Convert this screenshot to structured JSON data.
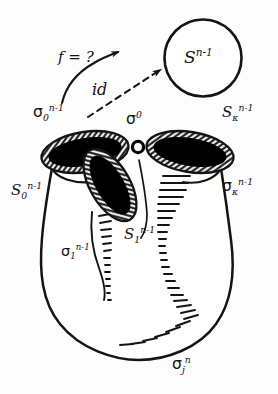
{
  "figure": {
    "background_color": "#fdfdfd",
    "ink_color": "#141414",
    "fill_color": "#000000"
  },
  "sphere": {
    "name": "target-sphere",
    "label_base": "S",
    "label_sup": "n-1",
    "cx": 203,
    "cy": 58,
    "r": 38
  },
  "arrows": [
    {
      "name": "f-arrow",
      "label": "f = ?",
      "style": "solid-curved",
      "label_x": 58,
      "label_y": 50
    },
    {
      "name": "id-arrow",
      "label": "id",
      "style": "dashed-straight",
      "label_x": 92,
      "label_y": 82
    }
  ],
  "labels": [
    {
      "name": "label-sigma-0-n-1",
      "base": "σ",
      "sub": "0",
      "sup": "n-1",
      "x": 33,
      "y": 103,
      "size": 15
    },
    {
      "name": "label-sigma-0-cell",
      "base": "σ",
      "sub": "",
      "sup": "0",
      "x": 126,
      "y": 110,
      "size": 15
    },
    {
      "name": "label-S-kappa-n-1",
      "base": "S",
      "sub": "κ",
      "sup": "n-1",
      "x": 222,
      "y": 103,
      "size": 15
    },
    {
      "name": "label-S-0-n-1",
      "base": "S",
      "sub": "0",
      "sup": "n-1",
      "x": 11,
      "y": 181,
      "size": 15
    },
    {
      "name": "label-sigma-kappa-n-1",
      "base": "σ",
      "sub": "κ",
      "sup": "n-1",
      "x": 222,
      "y": 177,
      "size": 15
    },
    {
      "name": "label-S-1-n-1",
      "base": "S",
      "sub": "1",
      "sup": "n-1",
      "x": 124,
      "y": 225,
      "size": 15
    },
    {
      "name": "label-sigma-1-n-1",
      "base": "σ",
      "sub": "1",
      "sup": "n-1",
      "x": 61,
      "y": 243,
      "size": 14
    },
    {
      "name": "label-sigma-j-n",
      "base": "σ",
      "sub": "j",
      "sup": "n",
      "x": 172,
      "y": 355,
      "size": 15
    }
  ],
  "sphere_label_position": {
    "x": 184,
    "y": 47,
    "size": 17
  }
}
